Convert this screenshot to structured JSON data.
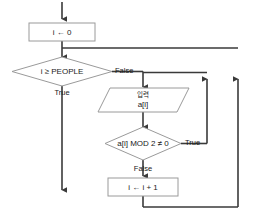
{
  "diagram": {
    "colors": {
      "background": "#ffffff",
      "shape_stroke": "#9a9a9a",
      "shape_fill": "#ffffff",
      "connector": "#3a3a3a",
      "text": "#1a1a1a"
    },
    "nodes": [
      {
        "id": "init",
        "type": "process",
        "text": "i ← 0"
      },
      {
        "id": "cond_people",
        "type": "decision",
        "text": "i ≥ PEOPLE"
      },
      {
        "id": "input",
        "type": "input-output",
        "line1": "입력",
        "line2": "a[i]"
      },
      {
        "id": "cond_odd",
        "type": "decision",
        "text": "a[i] MOD 2 ≠ 0"
      },
      {
        "id": "incr",
        "type": "process",
        "text": "i ← i + 1"
      }
    ],
    "edge_labels": {
      "people_false": "False",
      "people_true": "True",
      "odd_true": "True",
      "odd_false": "False"
    }
  }
}
